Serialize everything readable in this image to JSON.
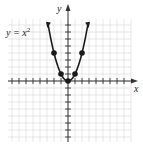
{
  "chart_data": {
    "type": "line",
    "title": "",
    "equation_label": "y = x²",
    "xlabel": "x",
    "ylabel": "y",
    "xlim": [
      -8,
      9
    ],
    "ylim": [
      -9,
      8
    ],
    "grid": true,
    "legend": null,
    "curve": "y = x^2",
    "points": [
      {
        "x": -2,
        "y": 4
      },
      {
        "x": -1,
        "y": 1
      },
      {
        "x": 0,
        "y": 0
      },
      {
        "x": 1,
        "y": 1
      },
      {
        "x": 2,
        "y": 4
      }
    ]
  },
  "labels": {
    "equation": "y = x",
    "exponent": "2",
    "x_axis": "x",
    "y_axis": "y"
  },
  "colors": {
    "curve": "#1a1a1a",
    "grid": "#d6d6d6",
    "axis": "#333333"
  }
}
